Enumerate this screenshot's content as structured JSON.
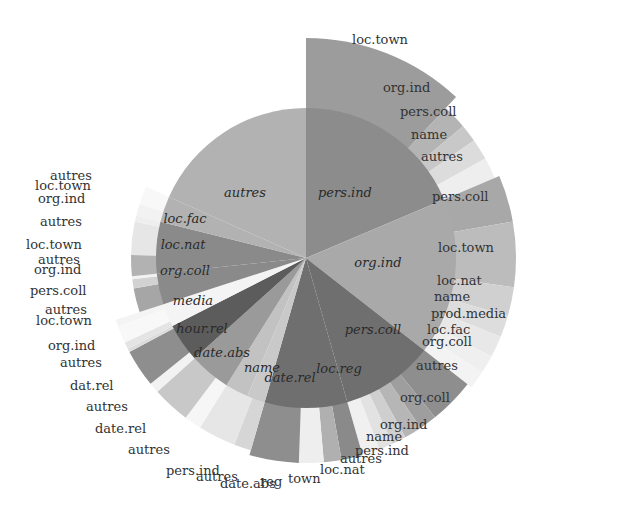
{
  "chart_data": {
    "type": "sunburst",
    "title": "",
    "center": [
      306,
      258
    ],
    "inner_radius": 150,
    "inner_ring": [
      {
        "label": "pers.ind",
        "start": 0,
        "end": 67,
        "color": "#8c8c8c",
        "label_pos": [
          345,
          197
        ]
      },
      {
        "label": "org.ind",
        "start": 67,
        "end": 128,
        "color": "#a9a9a9",
        "label_pos": [
          378,
          267
        ]
      },
      {
        "label": "pers.coll",
        "start": 128,
        "end": 164,
        "color": "#6f6f6f",
        "label_pos": [
          373,
          334
        ]
      },
      {
        "label": "loc.reg",
        "start": 164,
        "end": 196,
        "color": "#6f6f6f",
        "label_pos": [
          339,
          373
        ]
      },
      {
        "label": "date.rel",
        "start": 196,
        "end": 203,
        "color": "#c9c9c9",
        "label_pos": [
          290,
          382
        ]
      },
      {
        "label": "name",
        "start": 203,
        "end": 212,
        "color": "#c2c2c2",
        "label_pos": [
          262,
          372
        ]
      },
      {
        "label": "date.abs",
        "start": 212,
        "end": 228,
        "color": "#9a9a9a",
        "label_pos": [
          222,
          357
        ]
      },
      {
        "label": "hour.rel",
        "start": 228,
        "end": 243,
        "color": "#5c5c5c",
        "label_pos": [
          202,
          333
        ]
      },
      {
        "label": "media",
        "start": 243,
        "end": 252,
        "color": "#f4f4f4",
        "label_pos": [
          193,
          305
        ]
      },
      {
        "label": "org.coll",
        "start": 252,
        "end": 264,
        "color": "#8a8a8a",
        "label_pos": [
          185,
          275
        ]
      },
      {
        "label": "loc.nat",
        "start": 264,
        "end": 284,
        "color": "#8a8a8a",
        "label_pos": [
          183,
          249
        ]
      },
      {
        "label": "loc.fac",
        "start": 284,
        "end": 294,
        "color": "#b2b2b2",
        "label_pos": [
          185,
          223
        ]
      },
      {
        "label": "autres",
        "start": 294,
        "end": 360,
        "color": "#b2b2b2",
        "label_pos": [
          245,
          197
        ]
      }
    ],
    "outer_ring": [
      {
        "parent": "pers.ind",
        "label": "loc.town",
        "start": 0,
        "end": 43,
        "r": 220,
        "color": "#9c9c9c",
        "label_pos": [
          352,
          44
        ]
      },
      {
        "parent": "pers.ind",
        "label": "org.ind",
        "start": 43,
        "end": 50,
        "r": 205,
        "color": "#b4b4b4",
        "label_pos": [
          383,
          92
        ]
      },
      {
        "parent": "pers.ind",
        "label": "pers.coll",
        "start": 50,
        "end": 55,
        "r": 205,
        "color": "#c8c8c8",
        "label_pos": [
          400,
          116
        ]
      },
      {
        "parent": "pers.ind",
        "label": "name",
        "start": 55,
        "end": 61,
        "r": 205,
        "color": "#dcdcdc",
        "label_pos": [
          411,
          139
        ]
      },
      {
        "parent": "pers.ind",
        "label": "autres",
        "start": 61,
        "end": 67,
        "r": 205,
        "color": "#eeeeee",
        "label_pos": [
          421,
          161
        ]
      },
      {
        "parent": "org.ind",
        "label": "pers.coll",
        "start": 67,
        "end": 80,
        "r": 210,
        "color": "#a8a8a8",
        "label_pos": [
          432,
          201
        ]
      },
      {
        "parent": "org.ind",
        "label": "loc.town",
        "start": 80,
        "end": 98,
        "r": 210,
        "color": "#bcbcbc",
        "label_pos": [
          438,
          252
        ]
      },
      {
        "parent": "org.ind",
        "label": "loc.nat",
        "start": 98,
        "end": 106,
        "r": 210,
        "color": "#d0d0d0",
        "label_pos": [
          437,
          285
        ]
      },
      {
        "parent": "org.ind",
        "label": "name",
        "start": 106,
        "end": 112,
        "r": 210,
        "color": "#dddddd",
        "label_pos": [
          434,
          301
        ]
      },
      {
        "parent": "org.ind",
        "label": "prod.media",
        "start": 112,
        "end": 118,
        "r": 210,
        "color": "#e8e8e8",
        "label_pos": [
          431,
          318
        ]
      },
      {
        "parent": "org.ind",
        "label": "loc.fac",
        "start": 118,
        "end": 123,
        "r": 210,
        "color": "#efefef",
        "label_pos": [
          427,
          334
        ]
      },
      {
        "parent": "org.ind",
        "label": "org.coll",
        "start": 123,
        "end": 128,
        "r": 210,
        "color": "#f3f3f3",
        "label_pos": [
          422,
          346
        ]
      },
      {
        "parent": "pers.coll",
        "label": "autres",
        "start": 128,
        "end": 141,
        "r": 205,
        "color": "#8e8e8e",
        "label_pos": [
          416,
          370
        ]
      },
      {
        "parent": "pers.coll",
        "label": "org.coll",
        "start": 141,
        "end": 146,
        "r": 205,
        "color": "#9e9e9e",
        "label_pos": [
          400,
          402
        ]
      },
      {
        "parent": "pers.coll",
        "label": "org.ind",
        "start": 146,
        "end": 151,
        "r": 205,
        "color": "#b6b6b6",
        "label_pos": [
          380,
          429
        ]
      },
      {
        "parent": "pers.coll",
        "label": "name",
        "start": 151,
        "end": 155,
        "r": 205,
        "color": "#cfcfcf",
        "label_pos": [
          366,
          441
        ]
      },
      {
        "parent": "pers.coll",
        "label": "pers.ind",
        "start": 155,
        "end": 159,
        "r": 205,
        "color": "#e2e2e2",
        "label_pos": [
          355,
          455
        ]
      },
      {
        "parent": "pers.coll",
        "label": "autres",
        "start": 159,
        "end": 164,
        "r": 205,
        "color": "#f0f0f0",
        "label_pos": [
          340,
          463
        ]
      },
      {
        "parent": "loc.reg",
        "label": "loc.nat",
        "start": 164,
        "end": 170,
        "r": 205,
        "color": "#8a8a8a",
        "label_pos": [
          320,
          474
        ]
      },
      {
        "parent": "loc.reg",
        "label": "town",
        "start": 170,
        "end": 175,
        "r": 205,
        "color": "#b0b0b0",
        "label_pos": [
          288,
          483
        ]
      },
      {
        "parent": "loc.reg",
        "label": "reg",
        "start": 175,
        "end": 182,
        "r": 205,
        "color": "#eeeeee",
        "label_pos": [
          260,
          486
        ]
      },
      {
        "parent": "loc.reg",
        "label": "date.abs",
        "start": 182,
        "end": 196,
        "r": 205,
        "color": "#8e8e8e",
        "label_pos": [
          220,
          488
        ]
      },
      {
        "parent": "date.rel",
        "label": "autres",
        "start": 196,
        "end": 201,
        "r": 200,
        "color": "#d6d6d6",
        "label_pos": [
          196,
          481
        ]
      },
      {
        "parent": "date.rel",
        "label": "pers.ind",
        "start": 201,
        "end": 212,
        "r": 200,
        "color": "#e6e6e6",
        "label_pos": [
          166,
          475
        ]
      },
      {
        "parent": "date.abs",
        "label": "autres",
        "start": 212,
        "end": 217,
        "r": 200,
        "color": "#f6f6f6",
        "label_pos": [
          128,
          454
        ]
      },
      {
        "parent": "date.abs",
        "label": "date.rel",
        "start": 217,
        "end": 228,
        "r": 200,
        "color": "#c8c8c8",
        "label_pos": [
          95,
          433
        ]
      },
      {
        "parent": "hour.rel",
        "label": "autres",
        "start": 228,
        "end": 231,
        "r": 200,
        "color": "#f2f2f2",
        "label_pos": [
          86,
          411
        ]
      },
      {
        "parent": "hour.rel",
        "label": "dat.rel",
        "start": 231,
        "end": 242,
        "r": 200,
        "color": "#8e8e8e",
        "label_pos": [
          70,
          390
        ]
      },
      {
        "parent": "hour.rel",
        "label": "autres",
        "start": 242,
        "end": 243,
        "r": 200,
        "color": "#dcdcdc",
        "label_pos": [
          60,
          367
        ]
      },
      {
        "parent": "media",
        "label": "org.ind",
        "start": 243,
        "end": 245,
        "r": 200,
        "color": "#e4e4e4",
        "label_pos": [
          48,
          350
        ]
      },
      {
        "parent": "media",
        "label": "loc.town",
        "start": 245,
        "end": 250,
        "r": 200,
        "color": "#f8f8f8",
        "label_pos": [
          36,
          325
        ]
      },
      {
        "parent": "media",
        "label": "autres",
        "start": 250,
        "end": 252,
        "r": 200,
        "color": "#f4f4f4",
        "label_pos": [
          45,
          314
        ]
      },
      {
        "parent": "org.coll",
        "label": "pers.coll",
        "start": 252,
        "end": 260,
        "r": 175,
        "color": "#a6a6a6",
        "label_pos": [
          30,
          295
        ]
      },
      {
        "parent": "org.coll",
        "label": "org.ind",
        "start": 260,
        "end": 263,
        "r": 175,
        "color": "#d2d2d2",
        "label_pos": [
          34,
          274
        ]
      },
      {
        "parent": "org.coll",
        "label": "autres",
        "start": 263,
        "end": 264,
        "r": 175,
        "color": "#f2f2f2",
        "label_pos": [
          38,
          264
        ]
      },
      {
        "parent": "loc.nat",
        "label": "loc.town",
        "start": 264,
        "end": 271,
        "r": 175,
        "color": "#b2b2b2",
        "label_pos": [
          26,
          249
        ]
      },
      {
        "parent": "loc.nat",
        "label": "autres",
        "start": 271,
        "end": 282,
        "r": 175,
        "color": "#e6e6e6",
        "label_pos": [
          40,
          226
        ]
      },
      {
        "parent": "loc.nat",
        "label": "org.ind",
        "start": 282,
        "end": 284,
        "r": 175,
        "color": "#eeeeee",
        "label_pos": [
          38,
          203
        ]
      },
      {
        "parent": "loc.fac",
        "label": "loc.town",
        "start": 284,
        "end": 288,
        "r": 175,
        "color": "#f2f2f2",
        "label_pos": [
          35,
          190
        ]
      },
      {
        "parent": "loc.fac",
        "label": "autres",
        "start": 288,
        "end": 294,
        "r": 175,
        "color": "#f8f8f8",
        "label_pos": [
          50,
          180
        ]
      }
    ]
  }
}
